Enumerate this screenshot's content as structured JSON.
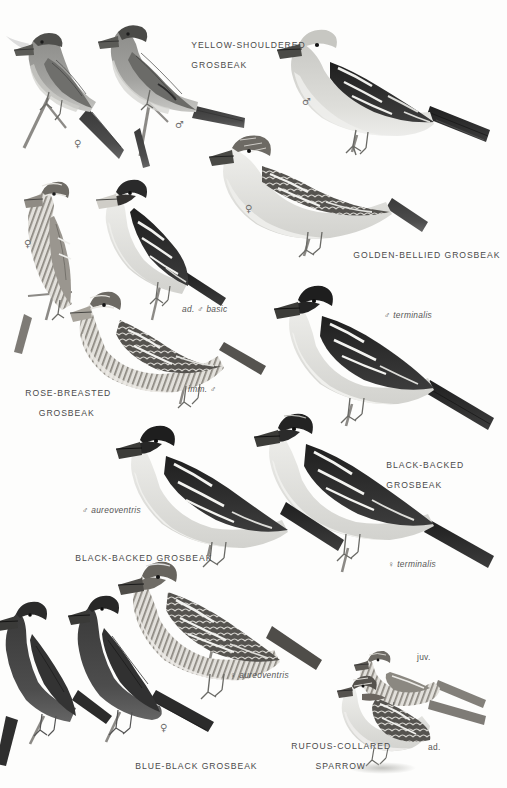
{
  "plate": {
    "title_visible": false,
    "background_color": "#fdfdfc",
    "ink_color": "#4c4c4c",
    "width": 507,
    "height": 788
  },
  "species_labels": [
    {
      "id": "yellow-shouldered-grosbeak",
      "lines": [
        "YELLOW-SHOULDERED",
        "GROSBEAK"
      ],
      "x": 178,
      "y": 30
    },
    {
      "id": "golden-bellied-grosbeak",
      "lines": [
        "GOLDEN-BELLIED GROSBEAK"
      ],
      "x": 340,
      "y": 240
    },
    {
      "id": "rose-breasted-grosbeak",
      "lines": [
        "ROSE-BREASTED",
        "GROSBEAK"
      ],
      "x": 12,
      "y": 378
    },
    {
      "id": "black-backed-grosbeak-right",
      "lines": [
        "BLACK-BACKED",
        "GROSBEAK"
      ],
      "x": 373,
      "y": 450
    },
    {
      "id": "black-backed-grosbeak-left",
      "lines": [
        "BLACK-BACKED GROSBEAK"
      ],
      "x": 62,
      "y": 543
    },
    {
      "id": "blue-black-grosbeak",
      "lines": [
        "BLUE-BLACK GROSBEAK"
      ],
      "x": 122,
      "y": 751
    },
    {
      "id": "rufous-collared-sparrow",
      "lines": [
        "RUFOUS-COLLARED",
        "SPARROW"
      ],
      "x": 278,
      "y": 731
    }
  ],
  "annotations": [
    {
      "id": "ad-male-basic",
      "text": "ad. ♂ basic",
      "x": 182,
      "y": 305
    },
    {
      "id": "imm-male",
      "text": "imm. ♂",
      "x": 188,
      "y": 385
    },
    {
      "id": "male-terminalis",
      "text": "♂ terminalis",
      "x": 384,
      "y": 311
    },
    {
      "id": "female-terminalis",
      "text": "♀ terminalis",
      "x": 388,
      "y": 560
    },
    {
      "id": "male-aureoventris",
      "text": "♂ aureoventris",
      "x": 82,
      "y": 506
    },
    {
      "id": "female-aureoventris",
      "text": "♀ aureoventris",
      "x": 230,
      "y": 671
    },
    {
      "id": "juvenile",
      "text": "juv.",
      "x": 417,
      "y": 653
    },
    {
      "id": "adult",
      "text": "ad.",
      "x": 428,
      "y": 743
    }
  ],
  "sex_symbols": [
    {
      "id": "ys-female",
      "glyph": "♀",
      "x": 74,
      "y": 138
    },
    {
      "id": "ys-male",
      "glyph": "♂",
      "x": 175,
      "y": 119
    },
    {
      "id": "gb-male",
      "glyph": "♂",
      "x": 302,
      "y": 96
    },
    {
      "id": "gb-female",
      "glyph": "♀",
      "x": 245,
      "y": 203
    },
    {
      "id": "rb-female",
      "glyph": "♀",
      "x": 24,
      "y": 238
    },
    {
      "id": "bb-female-blue",
      "glyph": "♀",
      "x": 160,
      "y": 722
    }
  ],
  "figures": [
    {
      "id": "yellow-shouldered-female",
      "species": "Yellow-shouldered Grosbeak",
      "sex": "female",
      "tone": "mid-gray"
    },
    {
      "id": "yellow-shouldered-male",
      "species": "Yellow-shouldered Grosbeak",
      "sex": "male",
      "tone": "mid-gray"
    },
    {
      "id": "golden-bellied-male",
      "species": "Golden-bellied Grosbeak",
      "sex": "male",
      "tone": "pale-with-black-wing"
    },
    {
      "id": "golden-bellied-female",
      "species": "Golden-bellied Grosbeak",
      "sex": "female",
      "tone": "streaked"
    },
    {
      "id": "rose-breasted-female",
      "species": "Rose-breasted Grosbeak",
      "sex": "female",
      "tone": "streaked-pale"
    },
    {
      "id": "rose-breasted-ad-male-basic",
      "species": "Rose-breasted Grosbeak",
      "sex": "ad. male basic",
      "tone": "black-and-white"
    },
    {
      "id": "rose-breasted-imm-male",
      "species": "Rose-breasted Grosbeak",
      "sex": "imm. male",
      "tone": "streaked-brown"
    },
    {
      "id": "black-backed-male-terminalis",
      "species": "Black-backed Grosbeak",
      "sex": "male terminalis",
      "tone": "black-and-white"
    },
    {
      "id": "black-backed-female-terminalis",
      "species": "Black-backed Grosbeak",
      "sex": "female terminalis",
      "tone": "black-and-white"
    },
    {
      "id": "black-backed-male-aureoventris",
      "species": "Black-backed Grosbeak",
      "sex": "male aureoventris",
      "tone": "black-and-white"
    },
    {
      "id": "black-backed-female-aureoventris",
      "species": "Black-backed Grosbeak",
      "sex": "female aureoventris",
      "tone": "streaked"
    },
    {
      "id": "blue-black-female",
      "species": "Blue-black Grosbeak",
      "sex": "female",
      "tone": "dark"
    },
    {
      "id": "blue-black-male",
      "species": "Blue-black Grosbeak",
      "sex": "male",
      "tone": "dark"
    },
    {
      "id": "rufous-collared-juvenile",
      "species": "Rufous-collared Sparrow",
      "sex": "juvenile",
      "tone": "streaked-pale"
    },
    {
      "id": "rufous-collared-adult",
      "species": "Rufous-collared Sparrow",
      "sex": "adult",
      "tone": "streaked-pale"
    }
  ]
}
